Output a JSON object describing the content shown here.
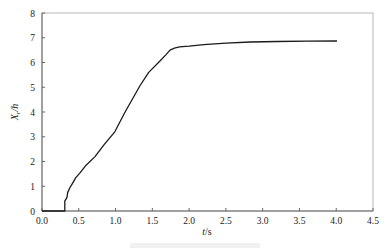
{
  "chart_data": {
    "type": "line",
    "title": "",
    "xlabel": "t/s",
    "ylabel": "X_r/h",
    "xlim": [
      0.0,
      4.5
    ],
    "ylim": [
      0,
      8
    ],
    "xticks": [
      "0.0",
      "0.5",
      "1.0",
      "1.5",
      "2.0",
      "2.5",
      "3.0",
      "3.5",
      "4.0",
      "4.5"
    ],
    "yticks": [
      "0",
      "1",
      "2",
      "3",
      "4",
      "5",
      "6",
      "7",
      "8"
    ],
    "grid": false,
    "legend": null,
    "series": [
      {
        "name": "X_r/h",
        "x": [
          0.0,
          0.31,
          0.31,
          0.34,
          0.35,
          0.38,
          0.41,
          0.46,
          0.52,
          0.6,
          0.72,
          0.85,
          0.99,
          1.13,
          1.33,
          1.45,
          1.6,
          1.68,
          1.74,
          1.8,
          1.87,
          2.0,
          2.2,
          2.5,
          2.83,
          3.2,
          3.6,
          4.01
        ],
        "y": [
          0.0,
          0.0,
          0.4,
          0.55,
          0.75,
          0.95,
          1.1,
          1.35,
          1.55,
          1.85,
          2.2,
          2.7,
          3.2,
          4.0,
          5.05,
          5.6,
          6.05,
          6.3,
          6.5,
          6.58,
          6.63,
          6.66,
          6.72,
          6.78,
          6.83,
          6.85,
          6.86,
          6.87
        ]
      }
    ]
  },
  "axis": {
    "x_title_italic": "t",
    "x_title_unit": "/s",
    "y_title_main": "X",
    "y_title_sub": "r",
    "y_title_unit": "/h"
  },
  "colors": {
    "line": "#1a1a1a",
    "axis": "#8c8c8c",
    "frame": "#b5b5b5"
  }
}
